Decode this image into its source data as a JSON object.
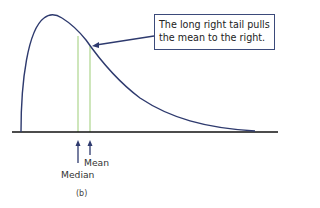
{
  "callout": {
    "line1": "The long right tail pulls",
    "line2": "the mean to the right."
  },
  "labels": {
    "mean": "Mean",
    "median": "Median"
  },
  "caption": "(b)",
  "colors": {
    "curve": "#2e3a6e",
    "axis": "#111111",
    "marker_lines": "#b9dc9e",
    "arrows": "#2e3a6e",
    "callout_border": "#3b4a7a"
  },
  "diagram": {
    "type": "right-skewed density curve",
    "markers": [
      {
        "name": "Median",
        "x_px": 78
      },
      {
        "name": "Mean",
        "x_px": 90
      }
    ]
  }
}
